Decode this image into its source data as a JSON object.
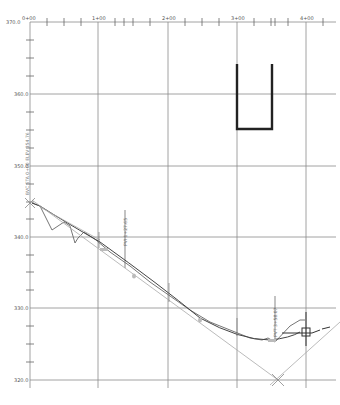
{
  "drawing": {
    "type": "profile-view",
    "stations": [
      {
        "label": "0+00",
        "x": 30
      },
      {
        "label": "1+00",
        "x": 98
      },
      {
        "label": "2+00",
        "x": 168
      },
      {
        "label": "3+00",
        "x": 237
      },
      {
        "label": "4+00",
        "x": 306
      }
    ],
    "elevations": [
      {
        "label": "370.0",
        "y": 22
      },
      {
        "label": "360.0",
        "y": 94
      },
      {
        "label": "350.0",
        "y": 166
      },
      {
        "label": "340.0",
        "y": 237
      },
      {
        "label": "330.0",
        "y": 308
      },
      {
        "label": "320.0",
        "y": 380
      }
    ],
    "annotations": [
      {
        "text": "BVC STA 0+00 ELEV 354.76",
        "x": 30,
        "y": 150
      },
      {
        "text": "PVI 1+27.65",
        "x": 125,
        "y": 240
      },
      {
        "text": "PVT 3+58.07",
        "x": 270,
        "y": 315
      },
      {
        "text": "2+00",
        "x": 170,
        "y": 300
      },
      {
        "text": "3+00",
        "x": 238,
        "y": 325
      },
      {
        "text": "1+00",
        "x": 100,
        "y": 245
      }
    ],
    "colors": {
      "grid": "#8a8a8a",
      "profile": "#444444",
      "ground": "#666666",
      "tangent": "#aaaaaa",
      "structure": "#222222"
    }
  }
}
